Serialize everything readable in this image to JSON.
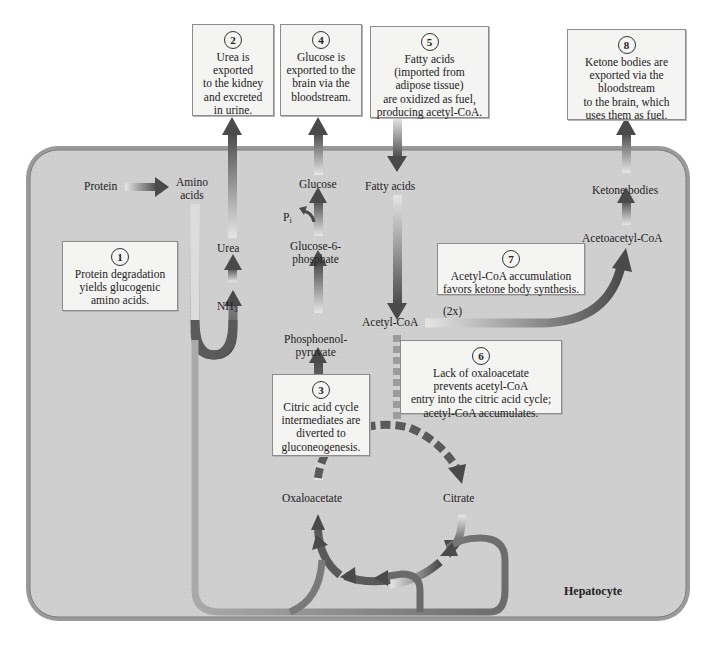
{
  "figure": {
    "cell_label": "Hepatocyte",
    "colors": {
      "cell_fill": "#cfcfcf",
      "cell_border": "#8a8a8a",
      "arrow_dark": "#4a4a4a",
      "arrow_light": "#e4e4e4",
      "box_fill": "#f4f4f2"
    }
  },
  "metabolites": {
    "protein": "Protein",
    "amino_acids_1": "Amino",
    "amino_acids_2": "acids",
    "urea": "Urea",
    "nh3_base": "NH",
    "nh3_sub": "3",
    "glucose": "Glucose",
    "pi_base": "P",
    "pi_sub": "i",
    "g6p_1": "Glucose-6-",
    "g6p_2": "phosphate",
    "pep_1": "Phosphoenol-",
    "pep_2": "pyruvate",
    "fatty_acids": "Fatty acids",
    "acetyl_coa": "Acetyl-CoA",
    "two_x": "(2x)",
    "acetoacetyl_coa": "Acetoacetyl-CoA",
    "ketone_bodies": "Ketone bodies",
    "oxaloacetate": "Oxaloacetate",
    "citrate": "Citrate"
  },
  "callouts": [
    {
      "num": "1",
      "text": "Protein degradation\nyields glucogenic\namino acids."
    },
    {
      "num": "2",
      "text": "Urea is\nexported\nto the kidney\nand excreted\nin urine."
    },
    {
      "num": "3",
      "text": "Citric acid cycle\nintermediates are\ndiverted to\ngluconeogenesis."
    },
    {
      "num": "4",
      "text": "Glucose is\nexported to the\nbrain via the\nbloodstream."
    },
    {
      "num": "5",
      "text": "Fatty acids\n(imported from\nadipose tissue)\nare oxidized as fuel,\nproducing acetyl-CoA."
    },
    {
      "num": "6",
      "text": "Lack of oxaloacetate\nprevents acetyl-CoA\nentry into the citric acid cycle;\nacetyl-CoA accumulates."
    },
    {
      "num": "7",
      "text": "Acetyl-CoA accumulation\nfavors ketone body synthesis."
    },
    {
      "num": "8",
      "text": "Ketone bodies are\nexported via the\nbloodstream\nto the brain, which\nuses them as fuel."
    }
  ]
}
